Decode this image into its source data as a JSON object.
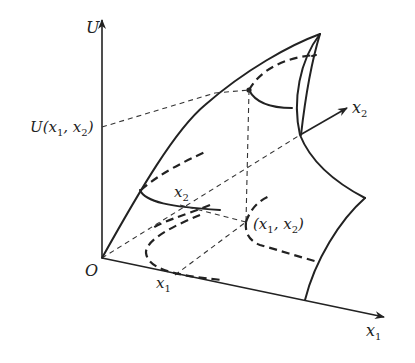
{
  "diagram": {
    "labels": {
      "u_axis": "U",
      "u_value": "U(x",
      "u_value_sub1": "1",
      "u_value_mid": ", x",
      "u_value_sub2": "2",
      "u_value_end": ")",
      "origin": "O",
      "x1_axis": "x",
      "x1_axis_sub": "1",
      "x2_axis": "x",
      "x2_axis_sub": "2",
      "x1_mark": "x",
      "x1_mark_sub": "1",
      "x2_mark": "x",
      "x2_mark_sub": "2",
      "point": "(x",
      "point_sub1": "1",
      "point_mid": ", x",
      "point_sub2": "2",
      "point_end": ")"
    },
    "colors": {
      "ink": "#222222",
      "background": "#ffffff"
    }
  }
}
